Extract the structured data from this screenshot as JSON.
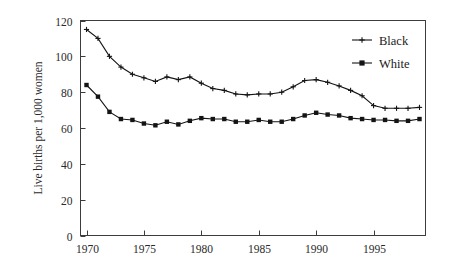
{
  "chart_data": {
    "type": "line",
    "title": "",
    "xlabel": "",
    "ylabel": "Live births per 1,000 women",
    "xlim": [
      1970,
      1999
    ],
    "ylim": [
      0,
      120
    ],
    "grid": false,
    "legend_position": "top-right",
    "x": [
      1970,
      1971,
      1972,
      1973,
      1974,
      1975,
      1976,
      1977,
      1978,
      1979,
      1980,
      1981,
      1982,
      1983,
      1984,
      1985,
      1986,
      1987,
      1988,
      1989,
      1990,
      1991,
      1992,
      1993,
      1994,
      1995,
      1996,
      1997,
      1998,
      1999
    ],
    "xticks": [
      1970,
      1975,
      1980,
      1985,
      1990,
      1995
    ],
    "xticklabels": [
      "1970",
      "1975",
      "1980",
      "1985",
      "1990",
      "1995"
    ],
    "yticks": [
      0,
      20,
      40,
      60,
      80,
      100,
      120
    ],
    "yticklabels": [
      "0",
      "20",
      "40",
      "60",
      "80",
      "100",
      "120"
    ],
    "series": [
      {
        "name": "Black",
        "marker": "plus",
        "color": "#141414",
        "values": [
          115,
          110,
          100,
          94,
          90,
          88,
          86,
          88.5,
          87,
          88.5,
          85,
          82,
          81,
          79,
          78.5,
          79,
          79,
          80,
          83,
          86.5,
          87,
          85.5,
          83.5,
          81,
          78,
          72.5,
          71,
          71,
          71,
          71.5
        ]
      },
      {
        "name": "White",
        "marker": "square",
        "color": "#141414",
        "values": [
          84,
          77.5,
          69,
          65,
          64.5,
          62.5,
          61.5,
          63.5,
          62,
          64,
          65.5,
          65,
          65,
          63.5,
          63.5,
          64.5,
          63.5,
          63.5,
          65,
          67,
          68.5,
          67.5,
          67,
          65.5,
          65,
          64.5,
          64.5,
          64,
          64,
          65
        ]
      }
    ]
  },
  "legend": {
    "items": [
      {
        "label": "Black"
      },
      {
        "label": "White"
      }
    ]
  },
  "axes": {
    "y_title": "Live births per 1,000 women"
  }
}
